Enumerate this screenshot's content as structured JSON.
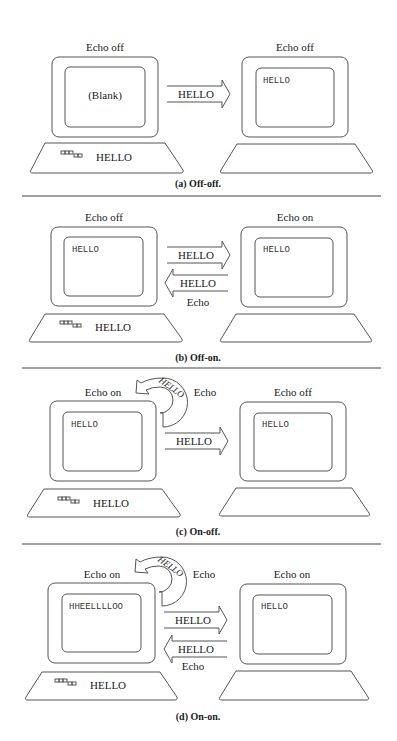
{
  "panels": [
    {
      "id": "a",
      "caption": "(a) Off-off.",
      "left": {
        "label": "Echo off",
        "screen_text": "(Blank)",
        "keyboard_text": "HELLO"
      },
      "right": {
        "label": "Echo off",
        "screen_text": "HELLO"
      },
      "arrows": [
        {
          "direction": "right",
          "label": "HELLO"
        }
      ]
    },
    {
      "id": "b",
      "caption": "(b) Off-on.",
      "left": {
        "label": "Echo off",
        "screen_text": "HELLO",
        "keyboard_text": "HELLO"
      },
      "right": {
        "label": "Echo on",
        "screen_text": "HELLO"
      },
      "arrows": [
        {
          "direction": "right",
          "label": "HELLO"
        },
        {
          "direction": "left",
          "label": "HELLO",
          "sublabel": "Echo"
        }
      ]
    },
    {
      "id": "c",
      "caption": "(c) On-off.",
      "left": {
        "label": "Echo on",
        "screen_text": "HELLO",
        "keyboard_text": "HELLO"
      },
      "right": {
        "label": "Echo off",
        "screen_text": "HELLO"
      },
      "local_echo": {
        "label": "HELLO",
        "sublabel": "Echo"
      },
      "arrows": [
        {
          "direction": "right",
          "label": "HELLO"
        }
      ]
    },
    {
      "id": "d",
      "caption": "(d) On-on.",
      "left": {
        "label": "Echo on",
        "screen_text": "HHEELLLLOO",
        "keyboard_text": "HELLO"
      },
      "right": {
        "label": "Echo on",
        "screen_text": "HELLO"
      },
      "local_echo": {
        "label": "HELLO",
        "sublabel": "Echo"
      },
      "arrows": [
        {
          "direction": "right",
          "label": "HELLO"
        },
        {
          "direction": "left",
          "label": "HELLO",
          "sublabel": "Echo"
        }
      ]
    }
  ],
  "colors": {
    "line": "#555555",
    "text": "#1a1a1a",
    "background": "#ffffff"
  }
}
